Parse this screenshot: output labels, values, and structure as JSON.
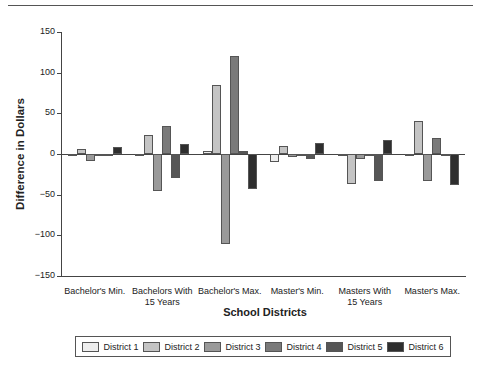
{
  "chart_data": {
    "type": "bar",
    "title": "",
    "xlabel": "School Districts",
    "ylabel": "Difference in Dollars",
    "ylim": [
      -150,
      150
    ],
    "yticks": [
      150,
      100,
      50,
      0,
      -50,
      -100,
      -150
    ],
    "grid": false,
    "legend_position": "bottom",
    "categories": [
      "Bachelor's Min.",
      "Bachelors With 15 Years",
      "Bachelor's Max.",
      "Master's Min.",
      "Masters With 15 Years",
      "Master's Max."
    ],
    "category_lines": [
      [
        "Bachelor's Min."
      ],
      [
        "Bachelors With",
        "15 Years"
      ],
      [
        "Bachelor's Max."
      ],
      [
        "Master's Min."
      ],
      [
        "Masters With",
        "15 Years"
      ],
      [
        "Master's Max."
      ]
    ],
    "series": [
      {
        "name": "District 1",
        "color": "#eeeeee",
        "values": [
          -3,
          -2,
          4,
          -10,
          -2,
          0
        ]
      },
      {
        "name": "District 2",
        "color": "#c4c4c4",
        "values": [
          6,
          23,
          85,
          10,
          -37,
          41
        ]
      },
      {
        "name": "District 3",
        "color": "#9a9a9a",
        "values": [
          -8,
          -45,
          -111,
          -4,
          -6,
          -33
        ]
      },
      {
        "name": "District 4",
        "color": "#7a7a7a",
        "values": [
          -2,
          35,
          120,
          -3,
          -2,
          20
        ]
      },
      {
        "name": "District 5",
        "color": "#565656",
        "values": [
          -3,
          -30,
          4,
          -6,
          -33,
          -1
        ]
      },
      {
        "name": "District 6",
        "color": "#2e2e2e",
        "values": [
          8,
          12,
          -43,
          14,
          17,
          -38
        ]
      }
    ]
  }
}
